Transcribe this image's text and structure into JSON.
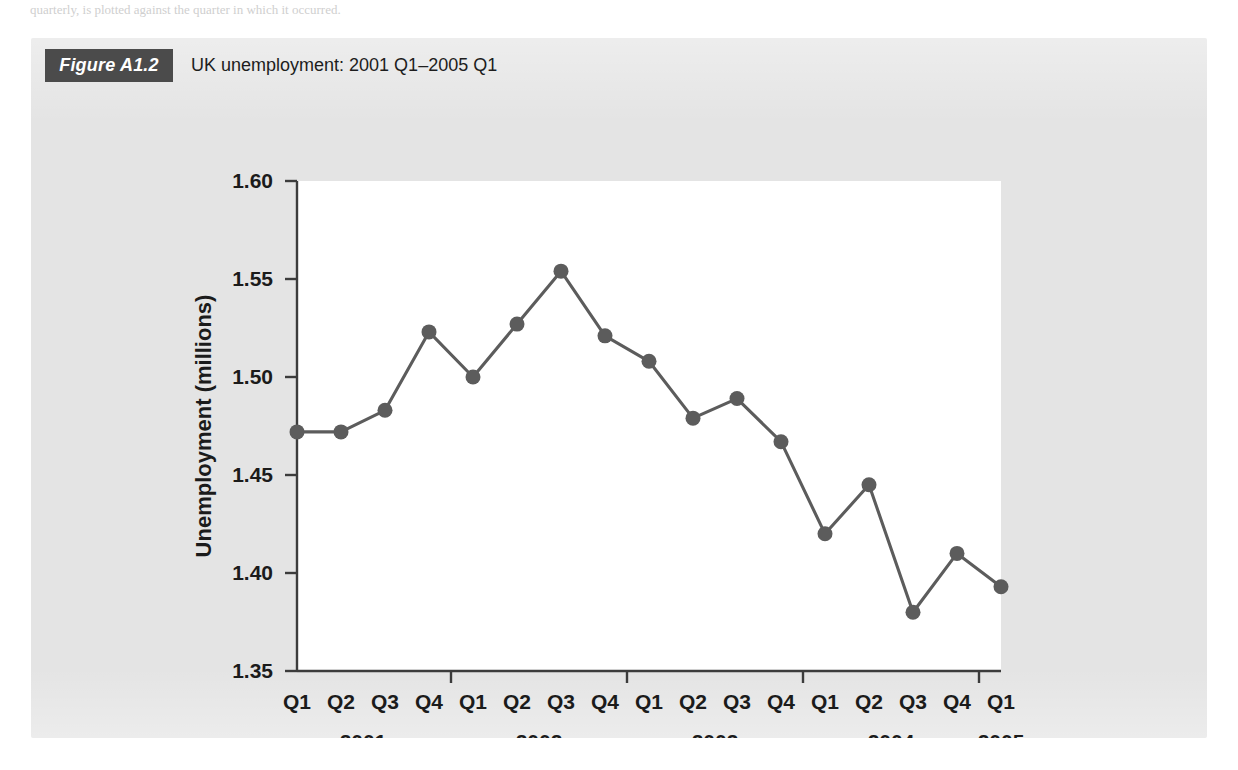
{
  "page": {
    "ghost_top": "quarterly, is plotted against the quarter in which it occurred.",
    "ghost_bottom": ""
  },
  "figure": {
    "badge_label": "Figure A1.2",
    "title": "UK unemployment: 2001 Q1–2005 Q1"
  },
  "colors": {
    "panel_background": "#e4e4e4",
    "plot_background": "#ffffff",
    "badge_background": "#4b4b4b",
    "badge_text": "#ffffff",
    "series": "#5c5c5c",
    "axis": "#3c3c3c",
    "text": "#1b1b1b"
  },
  "chart_data": {
    "type": "line",
    "title": "UK unemployment: 2001 Q1–2005 Q1",
    "xlabel": "",
    "ylabel": "Unemployment (millions)",
    "ylim": [
      1.35,
      1.6
    ],
    "yticks": [
      "1.35",
      "1.40",
      "1.45",
      "1.50",
      "1.55",
      "1.60"
    ],
    "ytick_values": [
      1.35,
      1.4,
      1.45,
      1.5,
      1.55,
      1.6
    ],
    "grid": false,
    "legend": "none",
    "markers": true,
    "categories": [
      "Q1",
      "Q2",
      "Q3",
      "Q4",
      "Q1",
      "Q2",
      "Q3",
      "Q4",
      "Q1",
      "Q2",
      "Q3",
      "Q4",
      "Q1",
      "Q2",
      "Q3",
      "Q4",
      "Q1"
    ],
    "year_groups": [
      {
        "label": "2001",
        "start_index": 0,
        "end_index": 3
      },
      {
        "label": "2002",
        "start_index": 4,
        "end_index": 7
      },
      {
        "label": "2003",
        "start_index": 8,
        "end_index": 11
      },
      {
        "label": "2004",
        "start_index": 12,
        "end_index": 15
      },
      {
        "label": "2005",
        "start_index": 16,
        "end_index": 16
      }
    ],
    "series": [
      {
        "name": "UK unemployment (millions)",
        "values": [
          1.472,
          1.472,
          1.483,
          1.523,
          1.5,
          1.527,
          1.554,
          1.521,
          1.508,
          1.479,
          1.489,
          1.467,
          1.42,
          1.445,
          1.38,
          1.41,
          1.393
        ],
        "point_labels": [
          "2001 Q1",
          "2001 Q2",
          "2001 Q3",
          "2001 Q4",
          "2002 Q1",
          "2002 Q2",
          "2002 Q3",
          "2002 Q4",
          "2003 Q1",
          "2003 Q2",
          "2003 Q3",
          "2003 Q4",
          "2004 Q1",
          "2004 Q2",
          "2004 Q3",
          "2004 Q4",
          "2005 Q1"
        ]
      }
    ]
  }
}
